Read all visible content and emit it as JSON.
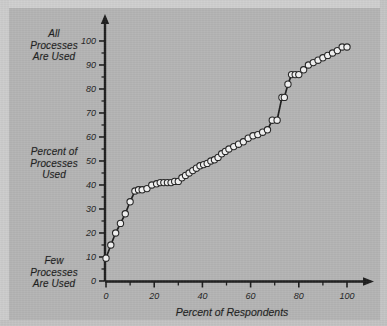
{
  "figure": {
    "background_color": "#b4b4b4",
    "ink_color": "#1d1d1d",
    "marker_fill": "#f2f2f2"
  },
  "labels": {
    "y_top": "All\nProcesses\nAre Used",
    "y_top_lines": [
      "All",
      "Processes",
      "Are Used"
    ],
    "y_middle_lines": [
      "Percent of",
      "Processes",
      "Used"
    ],
    "y_bottom_lines": [
      "Few",
      "Processes",
      "Are Used"
    ],
    "x_title": "Percent of Respondents"
  },
  "chart_data": {
    "type": "scatter",
    "title": "",
    "subtitle": "",
    "xlabel": "Percent of Respondents",
    "ylabel": "Percent of Processes Used",
    "ylabel_top_annotation": "All Processes Are Used",
    "ylabel_bottom_annotation": "Few Processes Are Used",
    "xlim": [
      0,
      100
    ],
    "ylim": [
      0,
      100
    ],
    "xticks": [
      0,
      20,
      40,
      60,
      80,
      100
    ],
    "xticklabels": [
      "0",
      "20",
      "40",
      "60",
      "80",
      "100"
    ],
    "xminorticks": [
      10,
      30,
      50,
      70,
      90
    ],
    "yticks": [
      0,
      10,
      20,
      30,
      40,
      50,
      60,
      70,
      80,
      90,
      100
    ],
    "yticklabels": [
      "0",
      "10",
      "20",
      "30",
      "40",
      "50",
      "60",
      "70",
      "80",
      "90",
      "100"
    ],
    "yminorticks": [
      5,
      15,
      25,
      35,
      45,
      55,
      65,
      75,
      85,
      95
    ],
    "grid": false,
    "legend": null,
    "marker": "circle",
    "line": "connected",
    "series": [
      {
        "name": "Cumulative percent of processes used",
        "x": [
          0,
          2,
          4,
          6,
          8,
          10,
          12,
          13.5,
          15,
          17,
          19,
          21,
          22.5,
          24,
          25.5,
          27,
          28.5,
          30,
          31.5,
          33,
          34.5,
          36,
          37.5,
          39,
          40.5,
          42,
          43.5,
          45,
          46.5,
          48,
          49.5,
          51,
          53,
          55,
          57,
          59,
          61,
          63,
          65,
          67,
          69,
          71,
          73,
          74,
          75.5,
          77,
          78.5,
          80,
          82,
          84,
          86,
          88,
          90,
          92,
          94,
          96,
          98,
          100
        ],
        "y": [
          9.5,
          15,
          20,
          24,
          28,
          33,
          37.5,
          38,
          38,
          38.5,
          40,
          40.5,
          41,
          41,
          41,
          41,
          41.5,
          41.5,
          43,
          44,
          45,
          46,
          47,
          48,
          48.5,
          49,
          50,
          50.5,
          51.5,
          53,
          54,
          55,
          56,
          57,
          58,
          59.5,
          60.5,
          61,
          62,
          63,
          67,
          67,
          76.5,
          76.5,
          82,
          86,
          86,
          86,
          88,
          90,
          91,
          92,
          93,
          94,
          95,
          96,
          97.5,
          97.5
        ]
      }
    ]
  }
}
